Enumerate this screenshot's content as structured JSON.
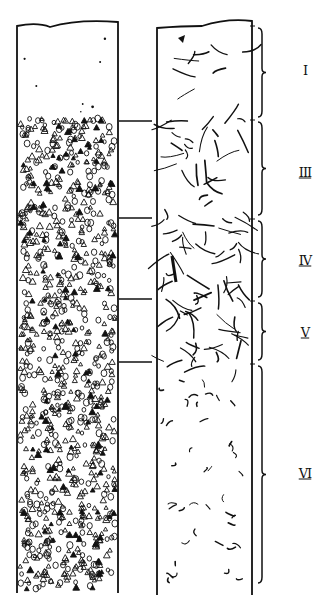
{
  "figure": {
    "type": "scientific-illustration",
    "columns": [
      {
        "id": "left",
        "pattern": "particles",
        "x_left": 17,
        "x_right": 118,
        "top": 22,
        "bottom": 593
      },
      {
        "id": "right",
        "pattern": "fibres",
        "x_left": 157,
        "x_right": 252,
        "top": 24,
        "bottom": 595
      }
    ],
    "tie_lines_y": [
      121,
      218,
      299,
      362
    ],
    "layers": [
      {
        "label": "I",
        "y_top": 28,
        "y_bottom": 117,
        "label_y": 70
      },
      {
        "label": "III",
        "y_top": 122,
        "y_bottom": 215,
        "label_y": 172
      },
      {
        "label": "IV",
        "y_top": 221,
        "y_bottom": 297,
        "label_y": 260
      },
      {
        "label": "V",
        "y_top": 303,
        "y_bottom": 360,
        "label_y": 332
      },
      {
        "label": "VI",
        "y_top": 366,
        "y_bottom": 583,
        "label_y": 473
      }
    ],
    "ink_color": "#111111",
    "background_color": "#ffffff"
  }
}
